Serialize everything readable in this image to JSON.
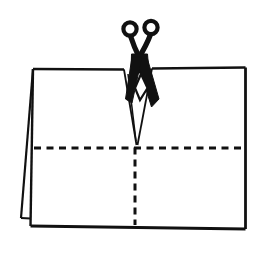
{
  "diagram": {
    "background_color": "#ffffff",
    "line_color": "#111111",
    "paper_fill": "#ffffff",
    "icons": [
      {
        "name": "scissors-icon",
        "meaning": "cut here"
      }
    ],
    "legend": {
      "dashed_line_meaning": "fold/cut guide line",
      "solid_line_meaning": "paper edge"
    },
    "shapes": [
      {
        "tag": "path",
        "name": "paper-top-edge-left",
        "attrs": {
          "d": "M33,69 L124,69.5",
          "stroke-width": 2.6
        }
      },
      {
        "tag": "path",
        "name": "paper-top-edge-right",
        "attrs": {
          "d": "M152,68.5 L245.5,67.5",
          "stroke-width": 2.6
        }
      },
      {
        "tag": "path",
        "name": "paper-right-edge",
        "attrs": {
          "d": "M245.5,67.5 L245.5,229",
          "stroke-width": 2.8
        }
      },
      {
        "tag": "path",
        "name": "paper-bottom-edge",
        "attrs": {
          "d": "M30.5,226 L245.5,229",
          "stroke-width": 2.8
        }
      },
      {
        "tag": "path",
        "name": "paper-left-edge",
        "attrs": {
          "d": "M33,69 L30.5,226",
          "stroke-width": 2.4
        }
      },
      {
        "tag": "path",
        "name": "fold-back-diagonal-edge",
        "attrs": {
          "d": "M33,69 L21,218",
          "stroke-width": 2.2
        }
      },
      {
        "tag": "path",
        "name": "fold-back-bottom-edge",
        "attrs": {
          "d": "M21,218 L30.5,218.5",
          "stroke-width": 2.2
        }
      },
      {
        "tag": "path",
        "name": "cut-notch-left-edge",
        "attrs": {
          "d": "M124,69.5 L136.5,145",
          "stroke-width": 1.8
        }
      },
      {
        "tag": "path",
        "name": "cut-notch-inner-line",
        "attrs": {
          "d": "M128,74 L136,141",
          "stroke-width": 1.5
        }
      },
      {
        "tag": "path",
        "name": "cut-notch-right-edge",
        "attrs": {
          "d": "M152,68.5 L137.5,145",
          "stroke-width": 1.8
        }
      },
      {
        "tag": "path",
        "name": "fold-line-horizontal-dashed",
        "attrs": {
          "d": "M34,148 L245,148",
          "stroke-width": 3,
          "stroke-dasharray": "7 5.5"
        }
      },
      {
        "tag": "path",
        "name": "cut-line-vertical-dashed",
        "attrs": {
          "d": "M135,147.5 L135,225",
          "stroke-width": 3,
          "stroke-dasharray": "7 5"
        }
      },
      {
        "tag": "circle",
        "name": "scissors-handle-left",
        "attrs": {
          "cx": 130,
          "cy": 29,
          "r": 6.6,
          "fill": "none",
          "stroke-width": 4.2
        }
      },
      {
        "tag": "circle",
        "name": "scissors-handle-right",
        "attrs": {
          "cx": 151,
          "cy": 27.5,
          "r": 6.6,
          "fill": "none",
          "stroke-width": 4.2
        }
      },
      {
        "tag": "path",
        "name": "scissors-shank-left",
        "attrs": {
          "d": "M130.5,36 C133,44 136,51 140,59",
          "stroke-width": 5.2
        }
      },
      {
        "tag": "path",
        "name": "scissors-shank-right",
        "attrs": {
          "d": "M150.5,34.5 C147,44 143,51 138,59",
          "stroke-width": 5.2
        }
      },
      {
        "tag": "polygon",
        "name": "scissors-pivot",
        "attrs": {
          "points": "131.5,54 147.5,54 149,73 131,73",
          "fill": "#111111",
          "stroke-width": 1
        }
      },
      {
        "tag": "polygon",
        "name": "scissors-blade-right",
        "attrs": {
          "points": "136,57 147.5,59 159,99 151.5,107",
          "fill": "#111111",
          "stroke-width": 1
        }
      },
      {
        "tag": "polygon",
        "name": "scissors-blade-left",
        "attrs": {
          "points": "142,57 132,57 125.5,99 132,103",
          "fill": "#111111",
          "stroke-width": 1
        }
      },
      {
        "tag": "polygon",
        "name": "scissors-gap-diamond",
        "attrs": {
          "points": "141,74 135,88 140,100 147.5,88",
          "fill": "#ffffff",
          "stroke-width": 2.2
        }
      }
    ]
  }
}
